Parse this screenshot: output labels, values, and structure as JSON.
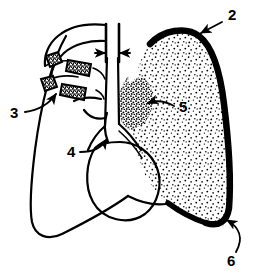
{
  "figure": {
    "background_color": "#ffffff",
    "ink_color": "#000000",
    "annotations": [
      {
        "id": "callout-2",
        "label": "2",
        "label_x": 228,
        "label_y": 16,
        "target": "apical pleural border of right lung (top of stippled lung field)",
        "leader_type": "straight-arrow",
        "leader_path": "M 222 22 L 199 34",
        "arrow_at": [
          197,
          36
        ]
      },
      {
        "id": "callout-3",
        "label": "3",
        "label_x": 14,
        "label_y": 114,
        "target": "anterior rib ends / clavicle segments on left side",
        "leader_type": "curved-arrow",
        "leader_path": "M 25 112 C 40 110 48 104 55 95",
        "arrow_at": [
          57,
          92
        ]
      },
      {
        "id": "callout-4",
        "label": "4",
        "label_x": 70,
        "label_y": 153,
        "target": "trachea and main bronchi",
        "leader_type": "curved-arrow",
        "leader_path": "M 80 152 C 93 151 100 148 106 140",
        "arrow_at": [
          108,
          137
        ]
      },
      {
        "id": "callout-5",
        "label": "5",
        "label_x": 180,
        "label_y": 108,
        "target": "dense hilar mass / opacity in right lung",
        "leader_type": "curved-arrow",
        "leader_path": "M 174 106 C 165 102 156 101 149 103",
        "arrow_at": [
          146,
          104
        ]
      },
      {
        "id": "callout-6",
        "label": "6",
        "label_x": 233,
        "label_y": 259,
        "target": "costophrenic angle of right lung",
        "leader_type": "curved-arrow",
        "leader_path": "M 234 250 C 241 238 238 228 227 221",
        "arrow_at": [
          224,
          219
        ]
      }
    ],
    "measurement": {
      "name": "mediastinal width measurement",
      "left_tick_x": 106,
      "right_tick_x": 124,
      "tick_top_y": 24,
      "tick_bottom_y": 62,
      "arrow_y": 53,
      "double_headed": true
    },
    "structures": [
      {
        "name": "right-lung-field",
        "fill": "stipple",
        "border": "thick-black",
        "side": "viewer-right"
      },
      {
        "name": "left-lung-field",
        "fill": "none",
        "border": "thin-black",
        "side": "viewer-left"
      },
      {
        "name": "hilar-mass",
        "fill": "dense-stipple",
        "side": "viewer-right"
      },
      {
        "name": "heart-shadow",
        "fill": "none",
        "border": "thin-black"
      },
      {
        "name": "rib-segment-upper",
        "fill": "dark-stipple"
      },
      {
        "name": "rib-segment-lower",
        "fill": "dark-stipple"
      },
      {
        "name": "clavicle-upper",
        "fill": "dark-stipple"
      },
      {
        "name": "clavicle-lower",
        "fill": "dark-stipple"
      },
      {
        "name": "trachea",
        "fill": "none",
        "border": "thin-black"
      },
      {
        "name": "diaphragm",
        "fill": "none",
        "border": "thin-black"
      }
    ]
  }
}
